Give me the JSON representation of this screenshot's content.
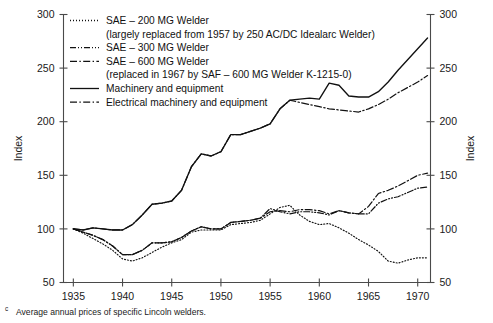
{
  "figure": {
    "footnote_marker": "c",
    "footnote": "Average annual prices of specific Lincoln welders."
  },
  "chart_data": {
    "type": "line",
    "title": "",
    "xlabel": "",
    "ylabel": "Index",
    "ylabel_right": "Index",
    "xlim": [
      1934,
      1971.3
    ],
    "ylim": [
      50,
      300
    ],
    "yticks": [
      50,
      100,
      150,
      200,
      250,
      300
    ],
    "ytick_labels": [
      "50",
      "100",
      "150",
      "200",
      "250",
      "300"
    ],
    "xticks": [
      1935,
      1940,
      1945,
      1950,
      1955,
      1960,
      1965,
      1970
    ],
    "xtick_labels": [
      "1935",
      "1940",
      "1945",
      "1950",
      "1955",
      "1960",
      "1965",
      "1970"
    ],
    "grid": false,
    "legend_position": "upper-left-inside",
    "x": [
      1935,
      1936,
      1937,
      1938,
      1939,
      1940,
      1941,
      1942,
      1943,
      1944,
      1945,
      1946,
      1947,
      1948,
      1949,
      1950,
      1951,
      1952,
      1953,
      1954,
      1955,
      1956,
      1957,
      1958,
      1959,
      1960,
      1961,
      1962,
      1963,
      1964,
      1965,
      1966,
      1967,
      1968,
      1969,
      1970,
      1971
    ],
    "series": [
      {
        "name": "SAE – 200 MG Welder",
        "note": "(largely replaced from 1957 by 250 AC/DC Idealarc Welder)",
        "style": "dotted",
        "legend_index": 0,
        "values": [
          100,
          96,
          91,
          86,
          80,
          72,
          70,
          73,
          78,
          83,
          87,
          90,
          97,
          99,
          99,
          99,
          104,
          105,
          106,
          108,
          114,
          120,
          122,
          113,
          107,
          104,
          105,
          101,
          96,
          90,
          85,
          79,
          70,
          68,
          71,
          73,
          73
        ]
      },
      {
        "name": "SAE – 300 MG Welder",
        "note": "",
        "style": "dash-dot-dot",
        "legend_index": 1,
        "values": [
          100,
          97,
          94,
          90,
          84,
          76,
          76,
          80,
          87,
          87,
          88,
          92,
          98,
          102,
          100,
          100,
          106,
          107,
          108,
          110,
          119,
          116,
          114,
          116,
          116,
          115,
          113,
          117,
          115,
          114,
          114,
          124,
          128,
          130,
          134,
          138,
          139
        ]
      },
      {
        "name": "SAE – 600 MG Welder",
        "note": "(replaced in 1967 by SAF – 600 MG Welder K-1215-0)",
        "style": "dash-dot",
        "legend_index": 2,
        "values": [
          100,
          97,
          94,
          90,
          84,
          76,
          76,
          80,
          87,
          87,
          88,
          92,
          98,
          102,
          100,
          100,
          106,
          107,
          108,
          110,
          116,
          117,
          116,
          118,
          118,
          117,
          114,
          117,
          115,
          114,
          121,
          133,
          136,
          140,
          145,
          150,
          152
        ]
      },
      {
        "name": "Machinery and equipment",
        "note": "",
        "style": "solid",
        "legend_index": 3,
        "values": [
          100,
          99,
          101,
          100,
          99,
          99,
          104,
          113,
          123,
          124,
          126,
          136,
          158,
          170,
          168,
          172,
          188,
          188,
          191,
          194,
          198,
          212,
          220,
          221,
          222,
          221,
          236,
          234,
          224,
          223,
          223,
          228,
          237,
          248,
          258,
          268,
          278
        ]
      },
      {
        "name": "Electrical machinery and equipment",
        "note": "",
        "style": "dash-dot",
        "legend_index": 4,
        "values": [
          100,
          99,
          101,
          100,
          99,
          99,
          104,
          113,
          123,
          124,
          126,
          136,
          158,
          170,
          168,
          172,
          188,
          188,
          191,
          194,
          198,
          212,
          220,
          218,
          216,
          214,
          212,
          211,
          210,
          209,
          212,
          216,
          221,
          227,
          232,
          237,
          243
        ]
      }
    ],
    "legend": [
      {
        "label": "SAE – 200 MG Welder",
        "style": "dotted"
      },
      {
        "label": "(largely replaced from 1957 by 250 AC/DC Idealarc Welder)",
        "style": "none"
      },
      {
        "label": "SAE – 300 MG Welder",
        "style": "dash-dot-dot"
      },
      {
        "label": "SAE – 600 MG Welder",
        "style": "dash-dot"
      },
      {
        "label": "(replaced in 1967 by SAF – 600 MG Welder K-1215-0)",
        "style": "none"
      },
      {
        "label": "Machinery and equipment",
        "style": "solid"
      },
      {
        "label": "Electrical machinery and equipment",
        "style": "dash-dot"
      }
    ]
  }
}
